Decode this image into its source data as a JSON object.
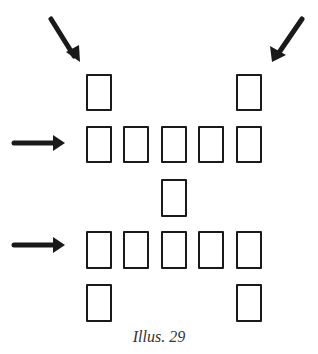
{
  "caption": "Illus. 29",
  "colors": {
    "ink": "#1a1a1a",
    "background": "#ffffff"
  },
  "cards": [
    {
      "id": "row1-left",
      "x": 86,
      "y": 74,
      "w": 26,
      "h": 37
    },
    {
      "id": "row1-right",
      "x": 236,
      "y": 74,
      "w": 26,
      "h": 37
    },
    {
      "id": "row2-1",
      "x": 86,
      "y": 126,
      "w": 26,
      "h": 37
    },
    {
      "id": "row2-2",
      "x": 123,
      "y": 126,
      "w": 26,
      "h": 37
    },
    {
      "id": "row2-3",
      "x": 161,
      "y": 126,
      "w": 26,
      "h": 37
    },
    {
      "id": "row2-4",
      "x": 198,
      "y": 126,
      "w": 26,
      "h": 37
    },
    {
      "id": "row2-5",
      "x": 236,
      "y": 126,
      "w": 26,
      "h": 37
    },
    {
      "id": "center",
      "x": 161,
      "y": 179,
      "w": 26,
      "h": 38
    },
    {
      "id": "row4-1",
      "x": 86,
      "y": 231,
      "w": 26,
      "h": 38
    },
    {
      "id": "row4-2",
      "x": 123,
      "y": 231,
      "w": 26,
      "h": 38
    },
    {
      "id": "row4-3",
      "x": 161,
      "y": 231,
      "w": 26,
      "h": 38
    },
    {
      "id": "row4-4",
      "x": 198,
      "y": 231,
      "w": 26,
      "h": 38
    },
    {
      "id": "row4-5",
      "x": 236,
      "y": 231,
      "w": 26,
      "h": 38
    },
    {
      "id": "row5-left",
      "x": 86,
      "y": 284,
      "w": 26,
      "h": 38
    },
    {
      "id": "row5-right",
      "x": 236,
      "y": 284,
      "w": 26,
      "h": 38
    }
  ],
  "arrows": [
    {
      "id": "arrow-top-left",
      "direction": "down-right"
    },
    {
      "id": "arrow-top-right",
      "direction": "down-left"
    },
    {
      "id": "arrow-row2",
      "direction": "right"
    },
    {
      "id": "arrow-row4",
      "direction": "right"
    }
  ]
}
